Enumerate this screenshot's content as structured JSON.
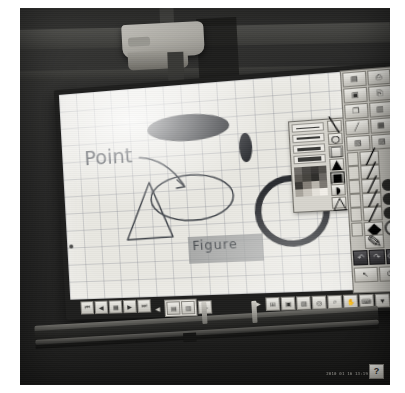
{
  "scene": {
    "kind": "photo-of-interactive-whiteboard",
    "device": "projector-mounted electronic whiteboard",
    "projector_label": "",
    "timestamp": "2010 01 16 13:19"
  },
  "canvas": {
    "background": "#e9e8e2",
    "grid_on": true,
    "grid_color": "#787d87",
    "annotations": [
      {
        "name": "point-label",
        "text": "Point",
        "kind": "handwriting"
      },
      {
        "name": "figure-label",
        "text": "Figure",
        "kind": "handwriting-on-highlight"
      }
    ],
    "shapes": [
      {
        "name": "filled-ellipse-large",
        "type": "ellipse",
        "fill": "#2e3034",
        "filled": true
      },
      {
        "name": "filled-ellipse-small",
        "type": "ellipse",
        "fill": "#2e3034",
        "filled": true
      },
      {
        "name": "outline-ellipse",
        "type": "ellipse",
        "fill": "none",
        "stroke": "#3e4248"
      },
      {
        "name": "triangle",
        "type": "triangle",
        "fill": "none",
        "stroke": "#3e4248"
      },
      {
        "name": "thick-circle",
        "type": "circle",
        "fill": "none",
        "stroke": "#2a2c30"
      },
      {
        "name": "arrow",
        "type": "arrow",
        "stroke": "#3e4248"
      }
    ],
    "highlight_color": "#969898"
  },
  "palette": {
    "title": "",
    "line_widths": [
      1,
      2,
      3,
      5,
      7
    ],
    "colors": [
      "#6e6b66",
      "#4a4845",
      "#3a3836",
      "#514f4b",
      "#5c5954",
      "#46443f",
      "#2f2e2b",
      "#6a6762",
      "#3b3936",
      "#858079",
      "#b9b5ad",
      "#7c7872",
      "#a9a59d",
      "#cac6be",
      "#e6e3dc",
      "#f2efe9"
    ],
    "side_tools": [
      {
        "name": "line-tool",
        "glyph": "\\"
      },
      {
        "name": "ellipse-tool",
        "glyph": "○"
      },
      {
        "name": "rectangle-tool",
        "glyph": "□"
      },
      {
        "name": "triangle-tool",
        "glyph": "▲"
      },
      {
        "name": "polygon-tool",
        "glyph": "⬟"
      },
      {
        "name": "arc-tool",
        "glyph": "◔"
      },
      {
        "name": "fill-tool",
        "glyph": "△"
      }
    ]
  },
  "toolbar_right": {
    "top_buttons": [
      {
        "name": "new-page-button",
        "glyph": "▤"
      },
      {
        "name": "print-button",
        "glyph": "⎙"
      },
      {
        "name": "save-button",
        "glyph": "὚B"
      },
      {
        "name": "open-button",
        "glyph": "⎘"
      },
      {
        "name": "copy-button",
        "glyph": "❐"
      },
      {
        "name": "paste-button",
        "glyph": "✂"
      },
      {
        "name": "marker-button",
        "glyph": "╱"
      },
      {
        "name": "capture-button",
        "glyph": "❑"
      },
      {
        "name": "page-list-button",
        "glyph": "▥"
      },
      {
        "name": "settings-button",
        "glyph": "⚙"
      }
    ],
    "pen_rows": [
      {
        "name": "pen-row-1",
        "chip": true,
        "color": "",
        "hollow": false,
        "has_dot": false
      },
      {
        "name": "pen-row-2",
        "chip": true,
        "color": "",
        "hollow": false,
        "has_dot": false
      },
      {
        "name": "pen-row-3",
        "chip": true,
        "color": "#2a2a28",
        "hollow": false,
        "has_dot": true
      },
      {
        "name": "pen-row-4",
        "chip": true,
        "color": "#2a2a28",
        "hollow": false,
        "has_dot": true
      },
      {
        "name": "pen-row-5",
        "chip": true,
        "color": "#2a2a28",
        "hollow": false,
        "has_dot": true
      },
      {
        "name": "pen-row-6",
        "chip": true,
        "color": "",
        "hollow": true,
        "has_dot": true
      },
      {
        "name": "eraser-row",
        "chip": false,
        "color": "",
        "hollow": false,
        "has_dot": false
      }
    ],
    "dark_buttons": [
      {
        "name": "undo-button",
        "glyph": "↶"
      },
      {
        "name": "redo-button",
        "glyph": "↷"
      },
      {
        "name": "clear-button",
        "glyph": "⌫"
      },
      {
        "name": "pointer-button",
        "glyph": "↖"
      },
      {
        "name": "exit-button",
        "glyph": "⏻"
      }
    ]
  },
  "toolbar_bottom": {
    "left_group": [
      {
        "name": "page-first-button",
        "glyph": "⏮"
      },
      {
        "name": "page-prev-button",
        "glyph": "◀"
      },
      {
        "name": "page-thumb-button",
        "glyph": "▦"
      },
      {
        "name": "page-next-button",
        "glyph": "▶"
      },
      {
        "name": "page-last-button",
        "glyph": "⏭"
      }
    ],
    "page_nav": {
      "name": "page-indicator",
      "prev_glyph": "◀",
      "next_glyph": "▶"
    },
    "right_group": [
      {
        "name": "grid-toggle-button",
        "glyph": "⊞"
      },
      {
        "name": "screen-mode-button",
        "glyph": "☐"
      },
      {
        "name": "shade-button",
        "glyph": "▨"
      },
      {
        "name": "spotlight-button",
        "glyph": "◎"
      },
      {
        "name": "zoom-button",
        "glyph": "ὐD"
      },
      {
        "name": "hand-tool-button",
        "glyph": "✋"
      },
      {
        "name": "keyboard-button",
        "glyph": "⌨"
      },
      {
        "name": "more-button",
        "glyph": "▼"
      }
    ],
    "help_label": "?"
  },
  "pen_tray": {
    "name": "pen-tray",
    "pens": [
      "pen-1",
      "pen-2"
    ],
    "eraser": "tray-eraser"
  }
}
